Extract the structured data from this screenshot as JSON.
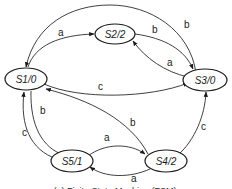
{
  "diagram": {
    "type": "finite-state-machine",
    "caption": "(a) Finite State Machine (FSM)",
    "states": [
      {
        "id": "S1",
        "label": "S1/0"
      },
      {
        "id": "S2",
        "label": "S2/2"
      },
      {
        "id": "S3",
        "label": "S3/0"
      },
      {
        "id": "S4",
        "label": "S4/2"
      },
      {
        "id": "S5",
        "label": "S5/1"
      }
    ],
    "transitions": [
      {
        "from": "S1",
        "to": "S2",
        "label": "a"
      },
      {
        "from": "S2",
        "to": "S3",
        "label": "b"
      },
      {
        "from": "S3",
        "to": "S2",
        "label": "a"
      },
      {
        "from": "S3",
        "to": "S1",
        "label": "b"
      },
      {
        "from": "S1",
        "to": "S3",
        "label": "c"
      },
      {
        "from": "S4",
        "to": "S1",
        "label": "b"
      },
      {
        "from": "S1",
        "to": "S5",
        "label": "b"
      },
      {
        "from": "S5",
        "to": "S1",
        "label": "c"
      },
      {
        "from": "S5",
        "to": "S4",
        "label": "a"
      },
      {
        "from": "S4",
        "to": "S5",
        "label": "a"
      },
      {
        "from": "S4",
        "to": "S3",
        "label": "c"
      }
    ]
  }
}
